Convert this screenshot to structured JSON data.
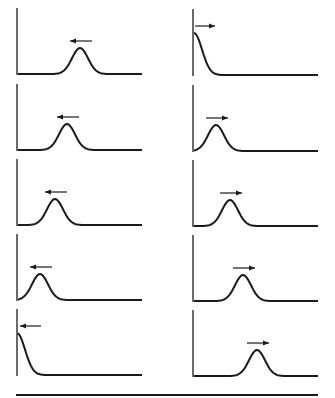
{
  "diagram": {
    "colors": {
      "ink": "#1a1a1a",
      "background": "#ffffff"
    },
    "columns": [
      {
        "name": "left-column",
        "axis_x": 17,
        "baseline_end_x": 142,
        "direction": "left",
        "panels": [
          {
            "baseline_y": 74,
            "peak_x": 80,
            "peak_height": 26
          },
          {
            "baseline_y": 150,
            "peak_x": 67,
            "peak_height": 26
          },
          {
            "baseline_y": 225,
            "peak_x": 55,
            "peak_height": 26
          },
          {
            "baseline_y": 300,
            "peak_x": 40,
            "peak_height": 26
          },
          {
            "baseline_y": 375,
            "peak_x": 17,
            "peak_height": 42,
            "half_pulse": true
          }
        ]
      },
      {
        "name": "right-column",
        "axis_x": 193,
        "baseline_end_x": 318,
        "direction": "right",
        "panels": [
          {
            "baseline_y": 75,
            "peak_x": 194,
            "peak_height": 42,
            "half_pulse": true
          },
          {
            "baseline_y": 151,
            "peak_x": 216,
            "peak_height": 26
          },
          {
            "baseline_y": 226,
            "peak_x": 230,
            "peak_height": 26
          },
          {
            "baseline_y": 301,
            "peak_x": 243,
            "peak_height": 26
          },
          {
            "baseline_y": 376,
            "peak_x": 257,
            "peak_height": 26
          }
        ]
      }
    ],
    "bottom_rule": {
      "x1": 16,
      "x2": 318,
      "y": 395
    }
  }
}
